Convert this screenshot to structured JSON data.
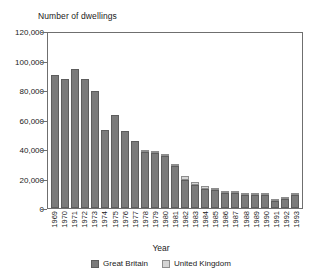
{
  "chart_data": {
    "type": "bar",
    "title": "",
    "ylabel": "Number of dwellings",
    "xlabel": "Year",
    "ylim": [
      0,
      120000
    ],
    "yticks": [
      0,
      20000,
      40000,
      60000,
      80000,
      100000,
      120000
    ],
    "ytick_labels": [
      "0",
      "20,000",
      "40,000",
      "60,000",
      "80,000",
      "100,000",
      "120,000"
    ],
    "grid": false,
    "legend_position": "bottom",
    "stacked": true,
    "categories": [
      "1969",
      "1970",
      "1971",
      "1972",
      "1973",
      "1974",
      "1975",
      "1976",
      "1977",
      "1978",
      "1979",
      "1980",
      "1981",
      "1982",
      "1983",
      "1984",
      "1985",
      "1986",
      "1987",
      "1988",
      "1989",
      "1990",
      "1991",
      "1992",
      "1993"
    ],
    "series": [
      {
        "name": "Great Britain",
        "color": "#7b7b7b",
        "values": [
          90000,
          87500,
          94500,
          87500,
          79000,
          53000,
          63000,
          52500,
          45500,
          38000,
          37000,
          35000,
          28500,
          19000,
          15500,
          13000,
          12000,
          10000,
          10000,
          8500,
          8500,
          8500,
          4500,
          6000,
          9000
        ]
      },
      {
        "name": "United Kingdom",
        "color": "#d5d5d5",
        "values": [
          0,
          0,
          0,
          0,
          0,
          0,
          0,
          0,
          0,
          1000,
          1000,
          1000,
          1500,
          2500,
          2000,
          2000,
          1500,
          1500,
          1500,
          1500,
          1500,
          1500,
          1000,
          1000,
          1500
        ]
      }
    ]
  },
  "legend": {
    "items": [
      {
        "label": "Great Britain"
      },
      {
        "label": "United Kingdom"
      }
    ]
  }
}
